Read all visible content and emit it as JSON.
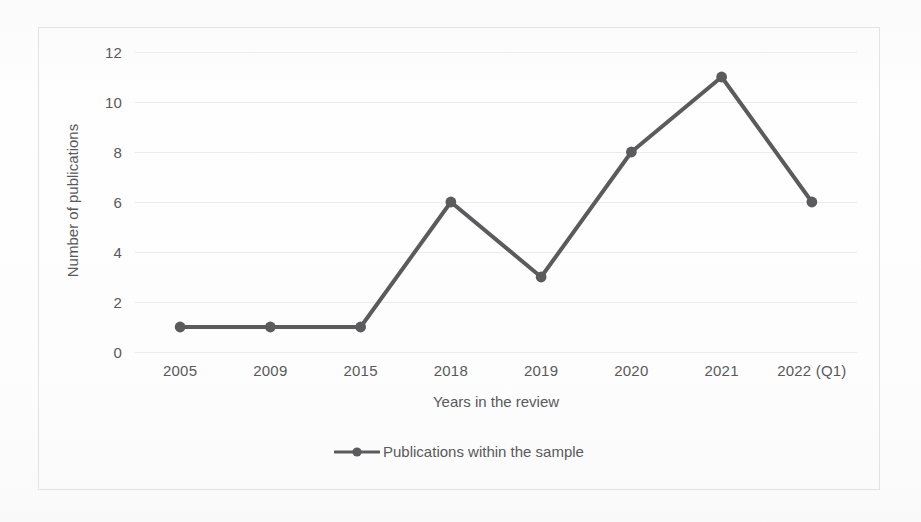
{
  "chart_data": {
    "type": "line",
    "title": "",
    "xlabel": "Years in the review",
    "ylabel": "Number of publications",
    "categories": [
      "2005",
      "2009",
      "2015",
      "2018",
      "2019",
      "2020",
      "2021",
      "2022 (Q1)"
    ],
    "series": [
      {
        "name": "Publications within the sample",
        "values": [
          1,
          1,
          1,
          6,
          3,
          8,
          11,
          6
        ]
      }
    ],
    "ylim": [
      0,
      12
    ],
    "y_ticks": [
      0,
      2,
      4,
      6,
      8,
      10,
      12
    ],
    "y_tick_labels": [
      "0",
      "2",
      "4",
      "6",
      "8",
      "10",
      "12"
    ],
    "grid": "horizontal",
    "legend_position": "bottom",
    "marker": "circle",
    "line_color": "#5b5b5d",
    "marker_color": "#5b5b5d",
    "grid_color": "#ececec",
    "text_color": "#59595b",
    "background_color": "#fdfdfd",
    "border_color": "#e2e2e2"
  },
  "legend": {
    "entries": [
      {
        "label": "Publications within the sample"
      }
    ]
  }
}
